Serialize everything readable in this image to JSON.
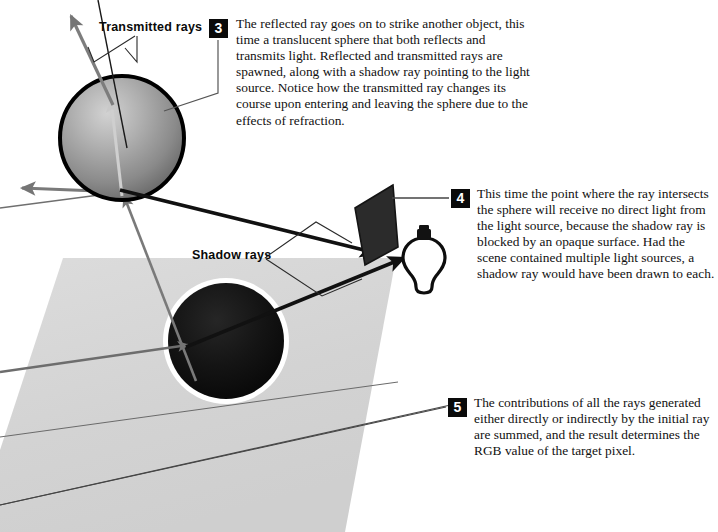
{
  "figure": {
    "background_color": "#ffffff"
  },
  "callouts": [
    {
      "number": "3",
      "text": "The reflected ray goes on to strike another object, this time a translucent sphere that both reflects and transmits light. Reflected and transmitted rays are spawned, along with a shadow ray pointing to the light source. Notice how the transmitted ray changes its course upon entering and leaving the sphere due to the effects of refraction."
    },
    {
      "number": "4",
      "text": "This time the point where the ray intersects the sphere will receive no direct light from the light source, because the shadow ray is blocked by an opaque surface. Had the scene contained multiple light sources, a shadow ray would have been drawn to each."
    },
    {
      "number": "5",
      "text": "The contributions of all the rays generated either directly or indirectly by the initial ray are summed, and the result determines the RGB value of the target pixel."
    }
  ],
  "labels": {
    "transmitted_rays": "Transmitted rays",
    "shadow_rays": "Shadow rays"
  },
  "objects": {
    "translucent_sphere": {
      "name": "translucent-sphere",
      "fill_light": "#b9b9b9",
      "fill_dark": "#6e6e6e",
      "outline": "#000000"
    },
    "opaque_sphere": {
      "name": "opaque-sphere",
      "fill": "#0d0d0d",
      "halo": "#ffffff"
    },
    "opaque_surface": {
      "name": "opaque-quad-surface",
      "fill": "#2a2a2a"
    },
    "light_bulb": {
      "name": "light-bulb",
      "glass_fill": "#ffffff",
      "outline": "#0a0a0a",
      "base_fill": "#111111"
    },
    "ground_plane": {
      "name": "shadow-ground-plane",
      "fill": "#d5d5d5"
    }
  },
  "colors": {
    "ray_gray": "#7a7a7a",
    "ray_black": "#111111",
    "leader_line": "#555555",
    "text": "#111111"
  }
}
